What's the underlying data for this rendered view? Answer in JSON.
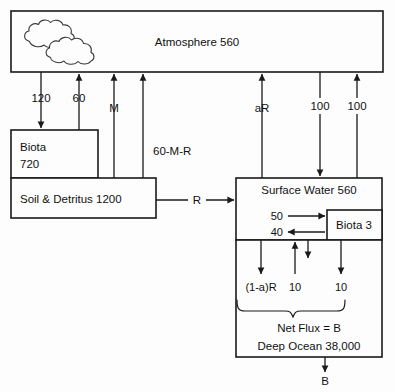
{
  "diagram": {
    "colors": {
      "background": "#fdfdfd",
      "stroke": "#1a1a1a",
      "text": "#111111",
      "cloud_stroke": "#3a3a3a"
    },
    "boxes": {
      "atmosphere": {
        "label": "Atmosphere 560"
      },
      "biota_land": {
        "line1": "Biota",
        "line2": "720"
      },
      "soil": {
        "label": "Soil & Detritus 1200"
      },
      "surface_water": {
        "label": "Surface Water 560"
      },
      "biota_ocean": {
        "label": "Biota 3"
      },
      "deep_ocean": {
        "line1": "Net Flux = B",
        "line2": "Deep Ocean 38,000"
      }
    },
    "flux_labels": {
      "photosynthesis": "120",
      "respiration": "60",
      "anthropogenic": "M",
      "soil_respiration": "60-M-R",
      "river_runoff": "R",
      "air_sea_uptake": "aR",
      "ocean_outgas": "100",
      "ocean_uptake": "100",
      "biota_uptake": "50",
      "biota_return": "40",
      "downwelling": "(1-a)R",
      "upwelling": "10",
      "sinking": "10",
      "net_flux_out": "B"
    },
    "icon": {
      "name": "cloud-icon"
    }
  }
}
